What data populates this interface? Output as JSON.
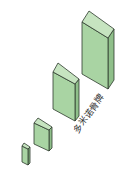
{
  "label": "多米诺骨牌",
  "colors": {
    "front": "#a9d4a3",
    "side": "#8fbf8a",
    "top": "#c6e4c0",
    "stroke": "#2d3a2d"
  },
  "boxes": [
    {
      "front": "22,146 28,149 28,165 22,162",
      "side": "28,149 30,147 30,163 28,165",
      "top": "22,146 24,143 30,147 28,149"
    },
    {
      "front": "34,123 49,130 49,151 34,144",
      "side": "49,130 52,127 52,148 49,151",
      "top": "34,123 38,118 52,127 49,130"
    },
    {
      "front": "53,72 75,84 75,121 53,109",
      "side": "75,84 79,79 79,116 75,121",
      "top": "53,72 58,63 79,79 75,84"
    },
    {
      "front": "82,22 108,38 108,89 82,74",
      "side": "108,38 114,29 114,80 108,89",
      "top": "82,22 89,11 114,29 108,38"
    }
  ]
}
